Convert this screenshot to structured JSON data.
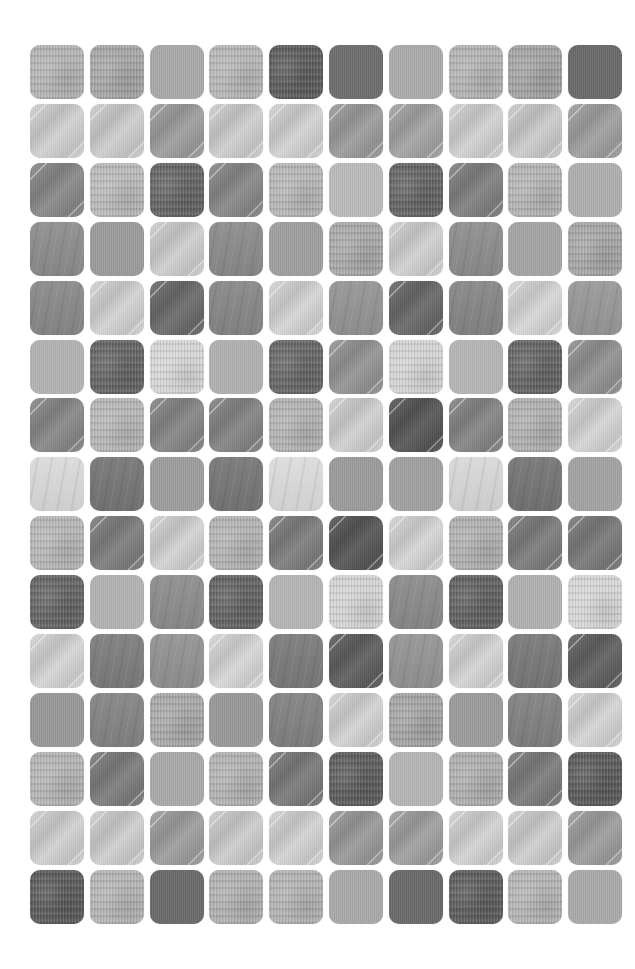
{
  "grid": {
    "columns": 10,
    "rows": 15,
    "origin": {
      "x": 30,
      "y": 45
    },
    "pitch": {
      "x": 59.8,
      "y": 58.9
    },
    "tile_size": 54,
    "corner_radius": 10,
    "background": "#ffffff",
    "tiles": [
      [
        [
          "fabric",
          "#b5b5b5"
        ],
        [
          "fabric",
          "#a8a8a8"
        ],
        [
          "flat",
          "#aaaaaa"
        ],
        [
          "fabric",
          "#b8b8b8"
        ],
        [
          "fabric",
          "#5e5e5e"
        ],
        [
          "flat",
          "#6e6e6e"
        ],
        [
          "flat",
          "#acacac"
        ],
        [
          "fabric",
          "#b5b5b5"
        ],
        [
          "fabric",
          "#a5a5a5"
        ],
        [
          "flat",
          "#6a6a6a"
        ]
      ],
      [
        [
          "brushed",
          "#d2d2d2"
        ],
        [
          "brushed",
          "#cfcfcf"
        ],
        [
          "brushed",
          "#9e9e9e"
        ],
        [
          "brushed",
          "#d0d0d0"
        ],
        [
          "brushed",
          "#d4d4d4"
        ],
        [
          "brushed",
          "#9c9c9c"
        ],
        [
          "brushed",
          "#a4a4a4"
        ],
        [
          "brushed",
          "#d3d3d3"
        ],
        [
          "brushed",
          "#cdcdcd"
        ],
        [
          "brushed",
          "#a0a0a0"
        ]
      ],
      [
        [
          "brushed",
          "#888888"
        ],
        [
          "fabric",
          "#bbbbbb"
        ],
        [
          "fabric",
          "#666666"
        ],
        [
          "brushed",
          "#888888"
        ],
        [
          "fabric",
          "#b8b8b8"
        ],
        [
          "flat",
          "#bcbcbc"
        ],
        [
          "fabric",
          "#666666"
        ],
        [
          "brushed",
          "#808080"
        ],
        [
          "fabric",
          "#b6b6b6"
        ],
        [
          "flat",
          "#b0b0b0"
        ]
      ],
      [
        [
          "streaked",
          "#8e8e8e"
        ],
        [
          "flat",
          "#9c9c9c"
        ],
        [
          "brushed",
          "#d0d0d0"
        ],
        [
          "streaked",
          "#8c8c8c"
        ],
        [
          "flat",
          "#a0a0a0"
        ],
        [
          "fabric",
          "#aaaaaa"
        ],
        [
          "brushed",
          "#d2d2d2"
        ],
        [
          "streaked",
          "#8e8e8e"
        ],
        [
          "flat",
          "#a6a6a6"
        ],
        [
          "fabric",
          "#a8a8a8"
        ]
      ],
      [
        [
          "streaked",
          "#8a8a8a"
        ],
        [
          "brushed",
          "#d4d4d4"
        ],
        [
          "brushed",
          "#6a6a6a"
        ],
        [
          "streaked",
          "#888888"
        ],
        [
          "brushed",
          "#d6d6d6"
        ],
        [
          "streaked",
          "#959595"
        ],
        [
          "brushed",
          "#686868"
        ],
        [
          "streaked",
          "#878787"
        ],
        [
          "brushed",
          "#d8d8d8"
        ],
        [
          "streaked",
          "#999999"
        ]
      ],
      [
        [
          "flat",
          "#b4b4b4"
        ],
        [
          "fabric",
          "#666666"
        ],
        [
          "fabric",
          "#d8d8d8"
        ],
        [
          "flat",
          "#b2b2b2"
        ],
        [
          "fabric",
          "#686868"
        ],
        [
          "brushed",
          "#959595"
        ],
        [
          "fabric",
          "#d6d6d6"
        ],
        [
          "flat",
          "#b6b6b6"
        ],
        [
          "fabric",
          "#666666"
        ],
        [
          "brushed",
          "#929292"
        ]
      ],
      [
        [
          "brushed",
          "#888888"
        ],
        [
          "fabric",
          "#b8b8b8"
        ],
        [
          "brushed",
          "#868686"
        ],
        [
          "brushed",
          "#848484"
        ],
        [
          "fabric",
          "#b5b5b5"
        ],
        [
          "brushed",
          "#d2d2d2"
        ],
        [
          "brushed",
          "#555555"
        ],
        [
          "brushed",
          "#858585"
        ],
        [
          "fabric",
          "#b2b2b2"
        ],
        [
          "brushed",
          "#d6d6d6"
        ]
      ],
      [
        [
          "streaked",
          "#dadada"
        ],
        [
          "streaked",
          "#777777"
        ],
        [
          "flat",
          "#9e9e9e"
        ],
        [
          "streaked",
          "#787878"
        ],
        [
          "streaked",
          "#dcdcdc"
        ],
        [
          "flat",
          "#9c9c9c"
        ],
        [
          "flat",
          "#a2a2a2"
        ],
        [
          "streaked",
          "#d8d8d8"
        ],
        [
          "streaked",
          "#767676"
        ],
        [
          "flat",
          "#a4a4a4"
        ]
      ],
      [
        [
          "fabric",
          "#b8b8b8"
        ],
        [
          "brushed",
          "#7e7e7e"
        ],
        [
          "brushed",
          "#d4d4d4"
        ],
        [
          "fabric",
          "#b5b5b5"
        ],
        [
          "brushed",
          "#7e7e7e"
        ],
        [
          "brushed",
          "#555555"
        ],
        [
          "brushed",
          "#d6d6d6"
        ],
        [
          "fabric",
          "#b2b2b2"
        ],
        [
          "brushed",
          "#7c7c7c"
        ],
        [
          "brushed",
          "#7a7a7a"
        ]
      ],
      [
        [
          "fabric",
          "#666666"
        ],
        [
          "flat",
          "#b4b4b4"
        ],
        [
          "streaked",
          "#8e8e8e"
        ],
        [
          "fabric",
          "#646464"
        ],
        [
          "flat",
          "#b6b6b6"
        ],
        [
          "fabric",
          "#d6d6d6"
        ],
        [
          "streaked",
          "#8c8c8c"
        ],
        [
          "fabric",
          "#626262"
        ],
        [
          "flat",
          "#b2b2b2"
        ],
        [
          "fabric",
          "#d8d8d8"
        ]
      ],
      [
        [
          "brushed",
          "#d6d6d6"
        ],
        [
          "streaked",
          "#7e7e7e"
        ],
        [
          "streaked",
          "#939393"
        ],
        [
          "brushed",
          "#d8d8d8"
        ],
        [
          "streaked",
          "#7c7c7c"
        ],
        [
          "brushed",
          "#5e5e5e"
        ],
        [
          "streaked",
          "#959595"
        ],
        [
          "brushed",
          "#d6d6d6"
        ],
        [
          "streaked",
          "#7a7a7a"
        ],
        [
          "brushed",
          "#606060"
        ]
      ],
      [
        [
          "flat",
          "#999999"
        ],
        [
          "streaked",
          "#858585"
        ],
        [
          "fabric",
          "#aaaaaa"
        ],
        [
          "flat",
          "#9a9a9a"
        ],
        [
          "streaked",
          "#838383"
        ],
        [
          "brushed",
          "#d4d4d4"
        ],
        [
          "fabric",
          "#a6a6a6"
        ],
        [
          "flat",
          "#9c9c9c"
        ],
        [
          "streaked",
          "#828282"
        ],
        [
          "brushed",
          "#d6d6d6"
        ]
      ],
      [
        [
          "fabric",
          "#b6b6b6"
        ],
        [
          "brushed",
          "#7c7c7c"
        ],
        [
          "flat",
          "#aaaaaa"
        ],
        [
          "fabric",
          "#b4b4b4"
        ],
        [
          "brushed",
          "#7a7a7a"
        ],
        [
          "fabric",
          "#5e5e5e"
        ],
        [
          "flat",
          "#b6b6b6"
        ],
        [
          "fabric",
          "#b0b0b0"
        ],
        [
          "brushed",
          "#7c7c7c"
        ],
        [
          "fabric",
          "#5c5c5c"
        ]
      ],
      [
        [
          "brushed",
          "#d2d2d2"
        ],
        [
          "brushed",
          "#d0d0d0"
        ],
        [
          "brushed",
          "#9e9e9e"
        ],
        [
          "brushed",
          "#cecece"
        ],
        [
          "brushed",
          "#d4d4d4"
        ],
        [
          "brushed",
          "#9a9a9a"
        ],
        [
          "brushed",
          "#a0a0a0"
        ],
        [
          "brushed",
          "#d4d4d4"
        ],
        [
          "brushed",
          "#d0d0d0"
        ],
        [
          "brushed",
          "#9e9e9e"
        ]
      ],
      [
        [
          "fabric",
          "#5c5c5c"
        ],
        [
          "fabric",
          "#b6b6b6"
        ],
        [
          "flat",
          "#6a6a6a"
        ],
        [
          "fabric",
          "#b2b2b2"
        ],
        [
          "fabric",
          "#b4b4b4"
        ],
        [
          "flat",
          "#aaaaaa"
        ],
        [
          "flat",
          "#6a6a6a"
        ],
        [
          "fabric",
          "#5e5e5e"
        ],
        [
          "fabric",
          "#b6b6b6"
        ],
        [
          "flat",
          "#ababab"
        ]
      ]
    ]
  }
}
